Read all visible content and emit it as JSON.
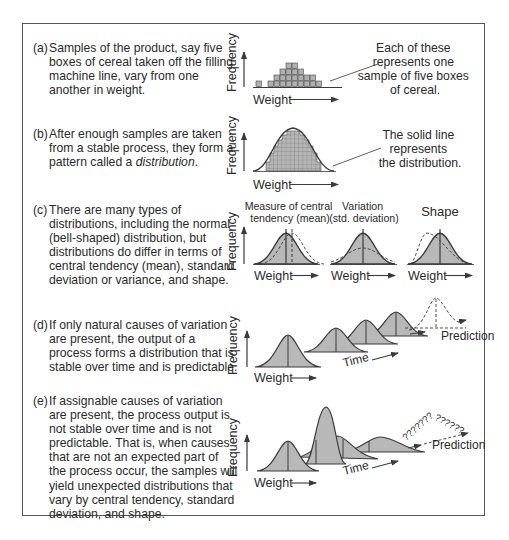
{
  "figure": {
    "sections": [
      {
        "label": "(a)",
        "lines": [
          "Samples of the product, say five",
          "boxes of cereal taken off the filling",
          "machine line, vary from one",
          "another in weight."
        ],
        "chart": {
          "ylabel": "Frequency",
          "xlabel": "Weight",
          "annotation": [
            "Each of these",
            "represents one",
            "sample of five boxes",
            "of cereal."
          ]
        }
      },
      {
        "label": "(b)",
        "lines": [
          "After enough samples are taken",
          "from a stable process, they form a",
          "pattern called a"
        ],
        "italic_word": "distribution",
        "chart": {
          "ylabel": "Frequency",
          "xlabel": "Weight",
          "annotation": [
            "The solid line",
            "represents",
            "the distribution."
          ]
        }
      },
      {
        "label": "(c)",
        "lines": [
          "There are many types of",
          "distributions, including the normal",
          "(bell-shaped) distribution, but",
          "distributions do differ in terms of",
          "central tendency (mean), standard",
          "deviation or variance, and shape."
        ],
        "chart": {
          "ylabel": "Frequency",
          "panels": [
            {
              "title": [
                "Measure of central",
                "tendency (mean)"
              ],
              "xlabel": "Weight"
            },
            {
              "title": [
                "Variation",
                "(std. deviation)"
              ],
              "xlabel": "Weight"
            },
            {
              "title": [
                "Shape"
              ],
              "xlabel": "Weight"
            }
          ]
        }
      },
      {
        "label": "(d)",
        "lines": [
          "If only natural causes of variation",
          "are present, the output of a",
          "process forms a distribution that is",
          "stable over time and is predictable."
        ],
        "chart": {
          "ylabel": "Frequency",
          "xlabel": "Weight",
          "time_label": "Time",
          "prediction_label": "Prediction"
        }
      },
      {
        "label": "(e)",
        "lines": [
          "If assignable causes of variation",
          "are present, the process output is",
          "not stable over time and is not",
          "predictable. That is, when causes",
          "that are not an expected part of",
          "the process occur, the samples will",
          "yield unexpected distributions that",
          "vary by central tendency, standard",
          "deviation, and shape."
        ],
        "chart": {
          "ylabel": "Frequency",
          "xlabel": "Weight",
          "time_label": "Time",
          "prediction_label": "Prediction",
          "question_marks": "??????????????"
        }
      }
    ]
  },
  "chart_data": [
    {
      "type": "bar",
      "title": "(a) Samples (stacked boxes)",
      "xlabel": "Weight",
      "ylabel": "Frequency",
      "categories": [
        1,
        2,
        3,
        4,
        5,
        6,
        7,
        8,
        9,
        10,
        11
      ],
      "values": [
        1,
        0,
        1,
        2,
        3,
        4,
        4,
        3,
        2,
        2,
        1
      ]
    },
    {
      "type": "area",
      "title": "(b) Distribution",
      "xlabel": "Weight",
      "ylabel": "Frequency",
      "series": [
        {
          "name": "distribution (solid line)",
          "shape": "normal"
        }
      ]
    }
  ],
  "colors": {
    "fill": "#b8b8b8",
    "stroke": "#3a3a3a",
    "border": "#555555",
    "text": "#2a2a2a"
  }
}
